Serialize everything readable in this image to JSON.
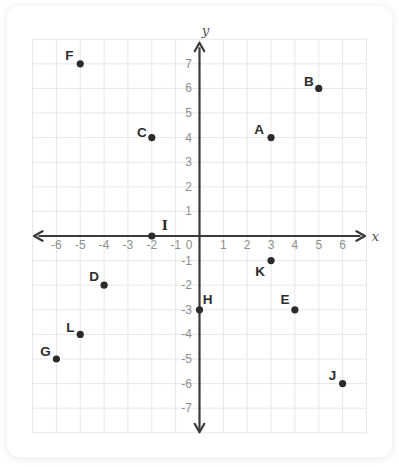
{
  "chart_data": {
    "type": "scatter",
    "title": "",
    "xlabel": "x",
    "ylabel": "y",
    "xlim": [
      -7,
      7
    ],
    "ylim": [
      -8,
      8
    ],
    "grid": true,
    "x_ticks": [
      -6,
      -5,
      -4,
      -3,
      -2,
      -1,
      0,
      1,
      2,
      3,
      4,
      5,
      6
    ],
    "y_ticks": [
      7,
      6,
      5,
      4,
      3,
      2,
      1,
      -1,
      -2,
      -3,
      -4,
      -5,
      -6,
      -7
    ],
    "points": [
      {
        "label": "A",
        "x": 3,
        "y": 4,
        "label_offset": [
          -12,
          -8
        ]
      },
      {
        "label": "B",
        "x": 5,
        "y": 6,
        "label_offset": [
          -10,
          -7
        ]
      },
      {
        "label": "C",
        "x": -2,
        "y": 4,
        "label_offset": [
          -10,
          -5
        ]
      },
      {
        "label": "D",
        "x": -4,
        "y": -2,
        "label_offset": [
          -10,
          -9
        ]
      },
      {
        "label": "E",
        "x": 4,
        "y": -3,
        "label_offset": [
          -10,
          -10
        ]
      },
      {
        "label": "F",
        "x": -5,
        "y": 7,
        "label_offset": [
          -11,
          -8
        ]
      },
      {
        "label": "G",
        "x": -6,
        "y": -5,
        "label_offset": [
          -11,
          -8
        ]
      },
      {
        "label": "H",
        "x": 0,
        "y": -3,
        "label_offset": [
          8,
          -10
        ]
      },
      {
        "label": "I",
        "x": -2,
        "y": 0,
        "label_offset": [
          13,
          -11
        ]
      },
      {
        "label": "J",
        "x": 6,
        "y": -6,
        "label_offset": [
          -10,
          -8
        ]
      },
      {
        "label": "K",
        "x": 3,
        "y": -1,
        "label_offset": [
          -11,
          11
        ]
      },
      {
        "label": "L",
        "x": -5,
        "y": -4,
        "label_offset": [
          -10,
          -7
        ]
      }
    ],
    "colors": {
      "grid": "#e7e7e7",
      "axis": "#3a3a3a",
      "tick_label": "#8e8e8e",
      "axis_name": "#555555",
      "point": "#2b2b2b",
      "point_label": "#2d2d2d"
    },
    "layout": {
      "origin_px": [
        199.5,
        236
      ],
      "unit_px": [
        23.85,
        24.6
      ],
      "legend": "none"
    }
  }
}
